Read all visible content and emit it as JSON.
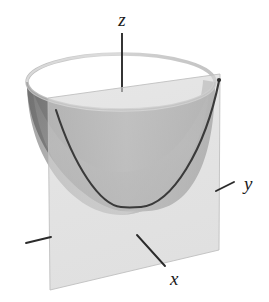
{
  "figure": {
    "kind": "3d-surface-sketch",
    "background_color": "#ffffff"
  },
  "axes": {
    "z": {
      "label": "z",
      "label_x": 122,
      "label_y": 26,
      "line": {
        "x1": 122,
        "y1": 33,
        "x2": 122,
        "y2": 92
      }
    },
    "y": {
      "label": "y",
      "label_x": 244,
      "label_y": 190,
      "tick": {
        "x1": 216,
        "y1": 191,
        "x2": 234,
        "y2": 182
      }
    },
    "x": {
      "label": "x",
      "label_x": 170,
      "label_y": 285,
      "tick": {
        "x1": 137,
        "y1": 235,
        "x2": 165,
        "y2": 266
      }
    },
    "left_tick": {
      "x1": 26,
      "y1": 243,
      "x2": 51,
      "y2": 237
    }
  },
  "colors": {
    "plane_front": "#d2d2d2",
    "plane_front_edge": "#c4c4c4",
    "paraboloid_outer": "#b4b4b4",
    "paraboloid_inner_wall": "#8b8b8b",
    "paraboloid_inner_behind_plane": "#919191",
    "paraboloid_bowl_shaded": "#9a9a9a",
    "rim_highlight": "#cfcfcf",
    "curve_stroke": "#3a3a3a",
    "axis_stroke": "#2b2b2b",
    "label_fill": "#1a1a1a"
  },
  "paraboloid": {
    "rim_ellipse": {
      "cx": 121,
      "cy": 82,
      "rx": 94,
      "ry": 28
    },
    "bottom_vertex": {
      "x": 140,
      "y": 212
    }
  },
  "plane": {
    "top_left": {
      "x": 48,
      "y": 98
    },
    "top_right": {
      "x": 220,
      "y": 74
    },
    "bottom_right": {
      "x": 219,
      "y": 250
    },
    "bottom_left": {
      "x": 50,
      "y": 290
    },
    "opacity": 0.62
  },
  "parabola": {
    "left_end": {
      "x": 56,
      "y": 110
    },
    "vertex": {
      "x": 139,
      "y": 207
    },
    "right_end": {
      "x": 219,
      "y": 81
    },
    "stroke_width": 2.1
  }
}
